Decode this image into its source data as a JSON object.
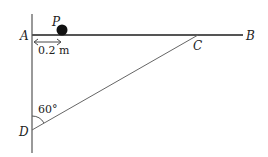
{
  "diagram": {
    "points": {
      "A": "A",
      "B": "B",
      "C": "C",
      "D": "D",
      "P": "P"
    },
    "distance_label": "0.2 m",
    "angle_label": "60°",
    "colors": {
      "line": "#555555",
      "ball": "#111111",
      "text": "#222222"
    }
  }
}
